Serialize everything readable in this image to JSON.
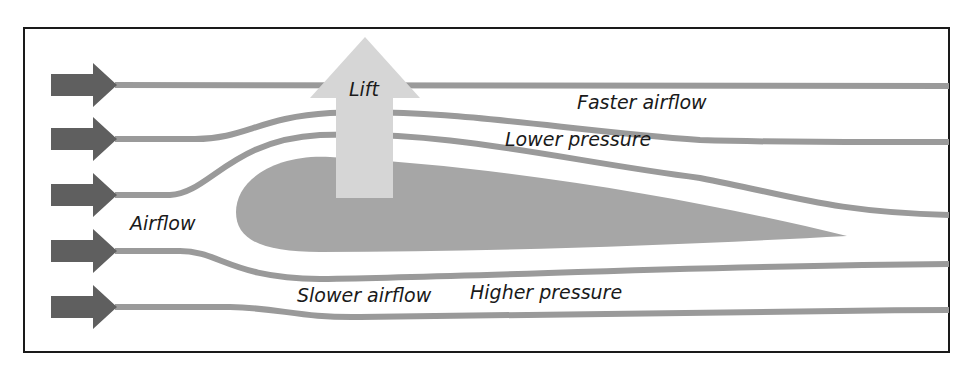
{
  "labels": {
    "lift": "Lift",
    "faster_airflow": "Faster airflow",
    "lower_pressure": "Lower pressure",
    "airflow": "Airflow",
    "slower_airflow": "Slower airflow",
    "higher_pressure": "Higher pressure"
  },
  "elements": {
    "inflow_arrows": 5,
    "streamlines": 5,
    "airfoil": "wing cross-section",
    "lift_arrow": "upward arrow"
  },
  "colors": {
    "frame": "#1a1a1a",
    "inflow_arrow": "#5f5f5f",
    "streamline": "#9a9a9a",
    "airfoil": "#a6a6a6",
    "lift_arrow": "#d6d6d6",
    "text": "#1a1a1a"
  }
}
